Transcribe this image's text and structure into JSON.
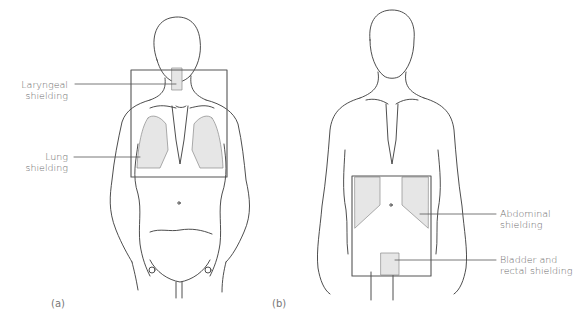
{
  "figure": {
    "panels": [
      {
        "id": "a",
        "label": "(a)",
        "annotations": [
          {
            "line1": "Laryngeal",
            "line2": "shielding"
          },
          {
            "line1": "Lung",
            "line2": "shielding"
          }
        ]
      },
      {
        "id": "b",
        "label": "(b)",
        "annotations": [
          {
            "line1": "Abdominal",
            "line2": "shielding"
          },
          {
            "line1": "Bladder and",
            "line2": "rectal shielding"
          }
        ]
      }
    ],
    "colors": {
      "outline": "#3a3a3a",
      "shield_fill": "#e6e6e6",
      "field_border": "#555555",
      "text": "#6a6a6a"
    }
  }
}
